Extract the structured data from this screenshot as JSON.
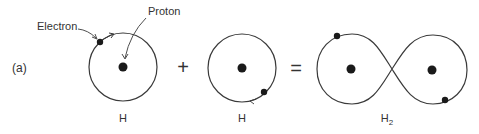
{
  "figure": {
    "panel_label": "(a)",
    "annotations": {
      "electron": "Electron",
      "proton": "Proton"
    },
    "operators": {
      "plus": "+",
      "equals": "="
    },
    "atoms": [
      {
        "label": "H"
      },
      {
        "label": "H"
      }
    ],
    "molecule": {
      "label": "H",
      "subscript": "2"
    },
    "colors": {
      "line": "#3a3a3a",
      "dot": "#1a1a1a",
      "text": "#333333"
    }
  }
}
